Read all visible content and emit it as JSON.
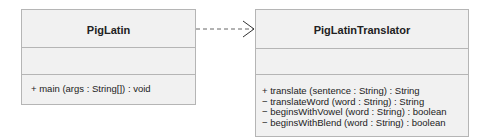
{
  "classes": [
    {
      "name": "PigLatin",
      "attributes": [],
      "operations": [
        "+ main (args : String[]) : void"
      ]
    },
    {
      "name": "PigLatinTranslator",
      "attributes": [],
      "operations": [
        "+ translate (sentence : String) : String",
        "− translateWord (word : String) : String",
        "− beginsWithVowel (word : String) : boolean",
        "− beginsWithBlend (word : String) : boolean"
      ]
    }
  ],
  "relationships": [
    {
      "from": "PigLatin",
      "to": "PigLatinTranslator",
      "type": "dependency"
    }
  ]
}
